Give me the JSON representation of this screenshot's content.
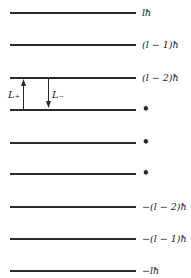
{
  "diagram": {
    "levels": [
      {
        "label": "lħ"
      },
      {
        "label": "(l − 1)ħ"
      },
      {
        "label": "(l − 2)ħ"
      },
      {
        "label": "•"
      },
      {
        "label": "•"
      },
      {
        "label": "•"
      },
      {
        "label": "−(l − 2)ħ"
      },
      {
        "label": "−(l − 1)ħ"
      },
      {
        "label": "−lħ"
      }
    ],
    "operators": {
      "raising": "L₊",
      "lowering": "L₋"
    }
  }
}
